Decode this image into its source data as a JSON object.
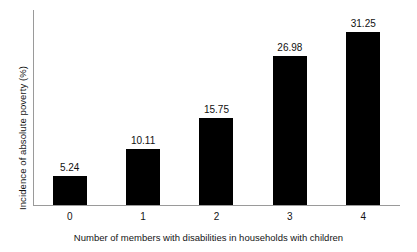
{
  "chart_data": {
    "type": "bar",
    "title": "",
    "subtitle": "",
    "categories": [
      "0",
      "1",
      "2",
      "3",
      "4"
    ],
    "values": [
      5.24,
      10.11,
      15.75,
      26.98,
      31.25
    ],
    "value_labels": [
      "5.24",
      "10.11",
      "15.75",
      "26.98",
      "31.25"
    ],
    "xlabel": "Number of members with disabilities in households with children",
    "ylabel": "Incidence of absolute poverty (%)",
    "ylim": [
      0,
      35.2
    ],
    "xlim": [
      -0.5,
      4.5
    ],
    "grid": false,
    "legend": null,
    "ytick_labels": [],
    "bar_color": "#000000",
    "axis_color": "#9a9a9a",
    "background_color": "#ffffff",
    "text_color": "#141414"
  }
}
